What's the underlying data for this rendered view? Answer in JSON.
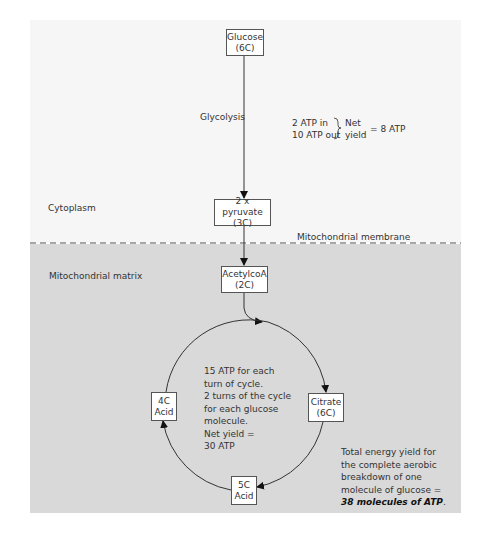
{
  "regions": {
    "cytoplasm": "Cytoplasm",
    "membrane": "Mitochondrial membrane",
    "matrix": "Mitochondrial matrix"
  },
  "nodes": {
    "glucose": {
      "name": "Glucose",
      "carbons": "(6C)"
    },
    "pyruvate": {
      "name": "2 x pyruvate",
      "carbons": "(3C)"
    },
    "acetylcoa": {
      "name": "AcetylcoA",
      "carbons": "(2C)"
    },
    "citrate": {
      "name": "Citrate",
      "carbons": "(6C)"
    },
    "acid5c": {
      "name": "5C",
      "carbons": "Acid"
    },
    "acid4c": {
      "name": "4C",
      "carbons": "Acid"
    }
  },
  "glycolysis": {
    "label": "Glycolysis",
    "atp_in": "2 ATP in",
    "atp_out": "10 ATP out",
    "net_line1": "Net",
    "net_line2": "yield",
    "net_value": "= 8 ATP"
  },
  "krebs": {
    "lines": [
      "15 ATP for each",
      "turn of cycle.",
      "2 turns of the cycle",
      "for each glucose",
      "molecule.",
      "Net yield =",
      "30 ATP"
    ]
  },
  "total": {
    "lines": [
      "Total energy yield for",
      "the complete aerobic",
      "breakdown of one",
      "molecule of glucose ="
    ],
    "emphasis": "38 molecules of ATP",
    "period": "."
  },
  "colors": {
    "cytoplasm_bg": "#f6f6f6",
    "matrix_bg": "#d9d9d9",
    "line": "#333333"
  }
}
